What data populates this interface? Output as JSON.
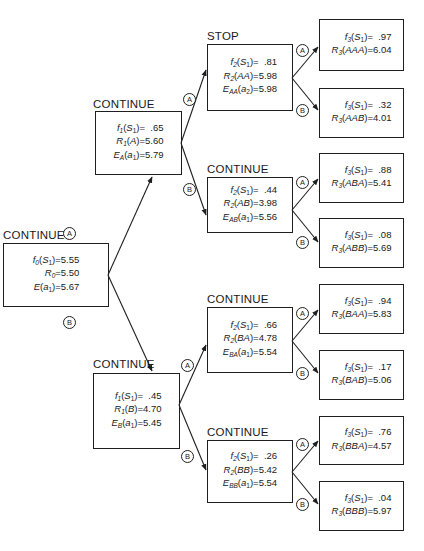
{
  "nodes": {
    "root": {
      "status": "CONTINUE",
      "lines": [
        {
          "fn": "f",
          "fsub": "0",
          "arg": "S",
          "argsub": "1",
          "val": "5.55"
        },
        {
          "fn": "R",
          "fsub": "0",
          "arg": "",
          "argsub": "",
          "val": "5.50"
        },
        {
          "fn": "E",
          "fsub": "",
          "arg": "a",
          "argsub": "1",
          "val": "5.67"
        }
      ]
    },
    "A": {
      "status": "CONTINUE",
      "lines": [
        {
          "fn": "f",
          "fsub": "1",
          "arg": "S",
          "argsub": "1",
          "val": "  .65"
        },
        {
          "fn": "R",
          "fsub": "1",
          "arg": "A",
          "argsub": "",
          "val": "5.60"
        },
        {
          "fn": "E",
          "fsub": "A",
          "arg": "a",
          "argsub": "1",
          "val": "5.79"
        }
      ]
    },
    "B": {
      "status": "CONTINUE",
      "lines": [
        {
          "fn": "f",
          "fsub": "1",
          "arg": "S",
          "argsub": "1",
          "val": "  .45"
        },
        {
          "fn": "R",
          "fsub": "1",
          "arg": "B",
          "argsub": "",
          "val": "4.70"
        },
        {
          "fn": "E",
          "fsub": "B",
          "arg": "a",
          "argsub": "1",
          "val": "5.45"
        }
      ]
    },
    "AA": {
      "status": "STOP",
      "lines": [
        {
          "fn": "f",
          "fsub": "2",
          "arg": "S",
          "argsub": "1",
          "val": "  .81"
        },
        {
          "fn": "R",
          "fsub": "2",
          "arg": "AA",
          "argsub": "",
          "val": "5.98"
        },
        {
          "fn": "E",
          "fsub": "AA",
          "arg": "a",
          "argsub": "2",
          "val": "5.98"
        }
      ]
    },
    "AB": {
      "status": "CONTINUE",
      "lines": [
        {
          "fn": "f",
          "fsub": "2",
          "arg": "S",
          "argsub": "1",
          "val": "  .44"
        },
        {
          "fn": "R",
          "fsub": "2",
          "arg": "AB",
          "argsub": "",
          "val": "3.98"
        },
        {
          "fn": "E",
          "fsub": "AB",
          "arg": "a",
          "argsub": "1",
          "val": "5.56"
        }
      ]
    },
    "BA": {
      "status": "CONTINUE",
      "lines": [
        {
          "fn": "f",
          "fsub": "2",
          "arg": "S",
          "argsub": "1",
          "val": "  .66"
        },
        {
          "fn": "R",
          "fsub": "2",
          "arg": "BA",
          "argsub": "",
          "val": "4.78"
        },
        {
          "fn": "E",
          "fsub": "BA",
          "arg": "a",
          "argsub": "1",
          "val": "5.54"
        }
      ]
    },
    "BB": {
      "status": "CONTINUE",
      "lines": [
        {
          "fn": "f",
          "fsub": "2",
          "arg": "S",
          "argsub": "1",
          "val": "  .26"
        },
        {
          "fn": "R",
          "fsub": "2",
          "arg": "BB",
          "argsub": "",
          "val": "5.42"
        },
        {
          "fn": "E",
          "fsub": "BB",
          "arg": "a",
          "argsub": "1",
          "val": "5.54"
        }
      ]
    },
    "AAA": {
      "lines": [
        {
          "fn": "f",
          "fsub": "3",
          "arg": "S",
          "argsub": "1",
          "val": "  .97"
        },
        {
          "fn": "R",
          "fsub": "3",
          "arg": "AAA",
          "argsub": "",
          "val": "6.04"
        }
      ]
    },
    "AAB": {
      "lines": [
        {
          "fn": "f",
          "fsub": "3",
          "arg": "S",
          "argsub": "1",
          "val": "  .32"
        },
        {
          "fn": "R",
          "fsub": "3",
          "arg": "AAB",
          "argsub": "",
          "val": "4.01"
        }
      ]
    },
    "ABA": {
      "lines": [
        {
          "fn": "f",
          "fsub": "3",
          "arg": "S",
          "argsub": "1",
          "val": "  .88"
        },
        {
          "fn": "R",
          "fsub": "3",
          "arg": "ABA",
          "argsub": "",
          "val": "5.41"
        }
      ]
    },
    "ABB": {
      "lines": [
        {
          "fn": "f",
          "fsub": "3",
          "arg": "S",
          "argsub": "1",
          "val": "  .08"
        },
        {
          "fn": "R",
          "fsub": "3",
          "arg": "ABB",
          "argsub": "",
          "val": "5.69"
        }
      ]
    },
    "BAA": {
      "lines": [
        {
          "fn": "f",
          "fsub": "3",
          "arg": "S",
          "argsub": "1",
          "val": "  .94"
        },
        {
          "fn": "R",
          "fsub": "3",
          "arg": "BAA",
          "argsub": "",
          "val": "5.83"
        }
      ]
    },
    "BAB": {
      "lines": [
        {
          "fn": "f",
          "fsub": "3",
          "arg": "S",
          "argsub": "1",
          "val": "  .17"
        },
        {
          "fn": "R",
          "fsub": "3",
          "arg": "BAB",
          "argsub": "",
          "val": "5.06"
        }
      ]
    },
    "BBA": {
      "lines": [
        {
          "fn": "f",
          "fsub": "3",
          "arg": "S",
          "argsub": "1",
          "val": "  .76"
        },
        {
          "fn": "R",
          "fsub": "3",
          "arg": "BBA",
          "argsub": "",
          "val": "4.57"
        }
      ]
    },
    "BBB": {
      "lines": [
        {
          "fn": "f",
          "fsub": "3",
          "arg": "S",
          "argsub": "1",
          "val": "  .04"
        },
        {
          "fn": "R",
          "fsub": "3",
          "arg": "BBB",
          "argsub": "",
          "val": "5.97"
        }
      ]
    }
  },
  "branch_labels": {
    "a": "A",
    "b": "B"
  }
}
